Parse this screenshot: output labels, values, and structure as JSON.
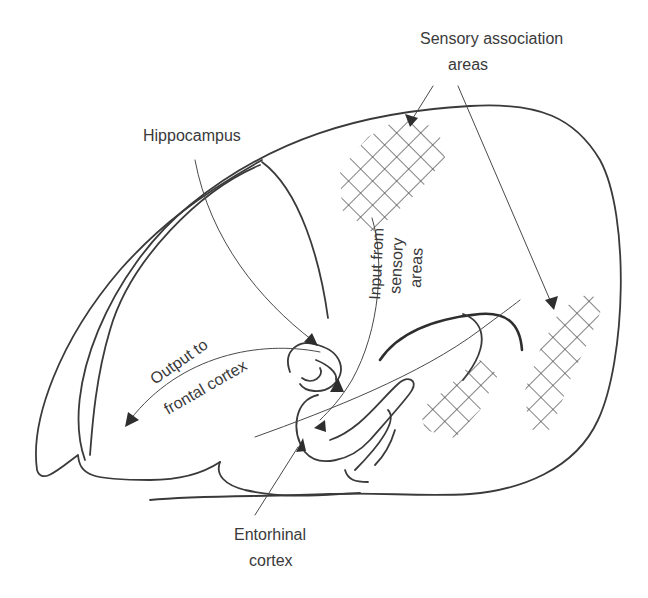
{
  "diagram": {
    "labels": {
      "sensory_association_line1": "Sensory association",
      "sensory_association_line2": "areas",
      "hippocampus": "Hippocampus",
      "input_line1": "Input from",
      "input_line2": "sensory",
      "input_line3": "areas",
      "output_line1": "Output to",
      "output_line2": "frontal cortex",
      "entorhinal_line1": "Entorhinal",
      "entorhinal_line2": "cortex"
    },
    "colors": {
      "line": "#3a3a3a",
      "background": "#ffffff"
    }
  }
}
